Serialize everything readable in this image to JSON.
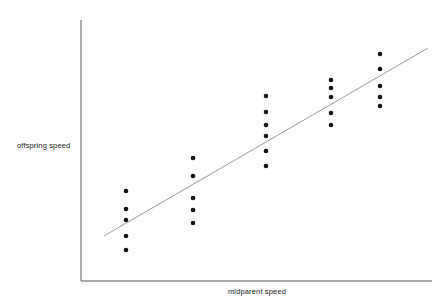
{
  "figure": {
    "width": 444,
    "height": 308,
    "background": "#ffffff"
  },
  "axes": {
    "x_label": "midparent speed",
    "y_label": "offspring speed",
    "axis_color": "#8c8c8c",
    "x_axis": {
      "x1": 81,
      "y1": 281,
      "x2": 432,
      "y2": 281
    },
    "y_axis": {
      "x1": 81,
      "y1": 20,
      "x2": 81,
      "y2": 281
    }
  },
  "marker": {
    "color": "#141414",
    "radius": 2.3,
    "shape": "circle"
  },
  "trendline": {
    "color": "#9a9a9a",
    "width": 1,
    "x1": 104,
    "y1": 236,
    "x2": 428,
    "y2": 48
  },
  "chart_data": {
    "type": "scatter",
    "title": "",
    "xlabel": "midparent speed",
    "ylabel": "offspring speed",
    "grid": false,
    "legend": null,
    "axis_ticks": {
      "x": [],
      "y": []
    },
    "xlim": [
      81,
      432
    ],
    "ylim": [
      281,
      20
    ],
    "note": "Unitless illustrative axes; values given in pixel coordinates of the plot area. Five midparent groups each with a vertical spread of offspring values.",
    "series": [
      {
        "name": "offspring observations",
        "points": [
          {
            "x": 126,
            "y": 191
          },
          {
            "x": 126,
            "y": 209
          },
          {
            "x": 126,
            "y": 220
          },
          {
            "x": 126,
            "y": 236
          },
          {
            "x": 126,
            "y": 250
          },
          {
            "x": 193,
            "y": 158
          },
          {
            "x": 193,
            "y": 176
          },
          {
            "x": 193,
            "y": 198
          },
          {
            "x": 193,
            "y": 210
          },
          {
            "x": 193,
            "y": 223
          },
          {
            "x": 266,
            "y": 96
          },
          {
            "x": 266,
            "y": 112
          },
          {
            "x": 266,
            "y": 125
          },
          {
            "x": 266,
            "y": 136
          },
          {
            "x": 266,
            "y": 151
          },
          {
            "x": 266,
            "y": 166
          },
          {
            "x": 331,
            "y": 80
          },
          {
            "x": 331,
            "y": 88
          },
          {
            "x": 331,
            "y": 97
          },
          {
            "x": 331,
            "y": 113
          },
          {
            "x": 331,
            "y": 125
          },
          {
            "x": 380,
            "y": 54
          },
          {
            "x": 380,
            "y": 69
          },
          {
            "x": 380,
            "y": 86
          },
          {
            "x": 380,
            "y": 97
          },
          {
            "x": 380,
            "y": 106
          }
        ]
      }
    ],
    "trendline": {
      "type": "linear-fit",
      "x": [
        104,
        428
      ],
      "y": [
        236,
        48
      ]
    }
  }
}
